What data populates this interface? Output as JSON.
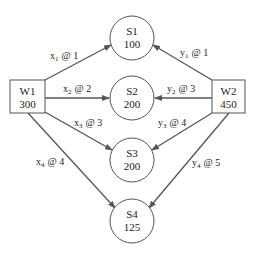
{
  "diagram": {
    "type": "transportation-network",
    "warehouses": [
      {
        "id": "W1",
        "label": "W1",
        "supply": "300"
      },
      {
        "id": "W2",
        "label": "W2",
        "supply": "450"
      }
    ],
    "stores": [
      {
        "id": "S1",
        "label": "S1",
        "demand": "100"
      },
      {
        "id": "S2",
        "label": "S2",
        "demand": "200"
      },
      {
        "id": "S3",
        "label": "S3",
        "demand": "200"
      },
      {
        "id": "S4",
        "label": "S4",
        "demand": "125"
      }
    ],
    "edges": [
      {
        "from": "W1",
        "to": "S1",
        "var": "x",
        "sub": "1",
        "cost": "@ 1"
      },
      {
        "from": "W1",
        "to": "S2",
        "var": "x",
        "sub": "2",
        "cost": "@ 2"
      },
      {
        "from": "W1",
        "to": "S3",
        "var": "x",
        "sub": "3",
        "cost": "@ 3"
      },
      {
        "from": "W1",
        "to": "S4",
        "var": "x",
        "sub": "4",
        "cost": "@ 4"
      },
      {
        "from": "W2",
        "to": "S1",
        "var": "y",
        "sub": "1",
        "cost": "@ 1"
      },
      {
        "from": "W2",
        "to": "S2",
        "var": "y",
        "sub": "2",
        "cost": "@ 3"
      },
      {
        "from": "W2",
        "to": "S3",
        "var": "y",
        "sub": "3",
        "cost": "@ 4"
      },
      {
        "from": "W2",
        "to": "S4",
        "var": "y",
        "sub": "4",
        "cost": "@ 5"
      }
    ],
    "colors": {
      "line": "#555555",
      "text": "#222222",
      "background": "#ffffff"
    }
  }
}
